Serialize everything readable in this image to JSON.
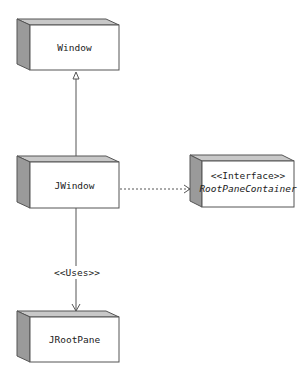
{
  "diagram": {
    "type": "uml-class-dependency",
    "colors": {
      "box_front": "#ffffff",
      "box_top": "#c8c8c8",
      "box_side": "#9a9a9a",
      "border": "#555555",
      "line": "#555555"
    },
    "nodes": [
      {
        "id": "window",
        "label": "Window"
      },
      {
        "id": "jwindow",
        "label": "JWindow"
      },
      {
        "id": "rootpanecontainer",
        "stereotype": "<<Interface>>",
        "label": "RootPaneContainer"
      },
      {
        "id": "jrootpane",
        "label": "JRootPane"
      }
    ],
    "edges": [
      {
        "from": "JWindow",
        "to": "Window",
        "kind": "generalization",
        "label": ""
      },
      {
        "from": "JWindow",
        "to": "RootPaneContainer",
        "kind": "realization-dotted",
        "label": ""
      },
      {
        "from": "JWindow",
        "to": "JRootPane",
        "kind": "dependency",
        "label": "<<Uses>>"
      }
    ]
  }
}
